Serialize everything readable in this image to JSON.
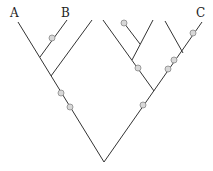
{
  "diagram": {
    "type": "phylogenetic-tree",
    "tip_labels": [
      "A",
      "B",
      "C"
    ],
    "colors": {
      "branch": "#333333",
      "marker_fill": "#d8d8d8",
      "marker_stroke": "#888888",
      "label": "#222222"
    }
  }
}
